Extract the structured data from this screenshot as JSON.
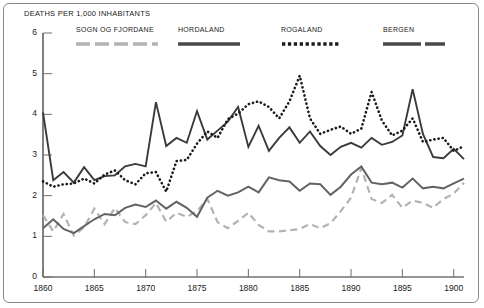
{
  "chart_data": {
    "type": "line",
    "title": "",
    "ylabel": "DEATHS PER 1,000 INHABITANTS",
    "xlabel": "",
    "xlim": [
      1860,
      1901
    ],
    "ylim": [
      0,
      6
    ],
    "grid": false,
    "legend_position": "top",
    "yticks": [
      "0",
      "1",
      "2",
      "3",
      "4",
      "5",
      "6"
    ],
    "ytick_values": [
      0,
      1,
      2,
      3,
      4,
      5,
      6
    ],
    "xticks": [
      "1860",
      "1865",
      "1870",
      "1875",
      "1880",
      "1885",
      "1890",
      "1895",
      "1900"
    ],
    "xtick_values": [
      1860,
      1865,
      1870,
      1875,
      1880,
      1885,
      1890,
      1895,
      1900
    ],
    "x": [
      1860,
      1861,
      1862,
      1863,
      1864,
      1865,
      1866,
      1867,
      1868,
      1869,
      1870,
      1871,
      1872,
      1873,
      1874,
      1875,
      1876,
      1877,
      1878,
      1879,
      1880,
      1881,
      1882,
      1883,
      1884,
      1885,
      1886,
      1887,
      1888,
      1889,
      1890,
      1891,
      1892,
      1893,
      1894,
      1895,
      1896,
      1897,
      1898,
      1899,
      1900,
      1901
    ],
    "series": [
      {
        "name": "SOGN OG FJORDANE",
        "style": "dashed",
        "color": "#b3b3b3",
        "values": [
          1.52,
          1.12,
          1.55,
          1.02,
          1.22,
          1.68,
          1.3,
          1.7,
          1.35,
          1.3,
          1.52,
          1.82,
          1.36,
          1.58,
          1.48,
          1.62,
          1.92,
          1.35,
          1.2,
          1.38,
          1.58,
          1.28,
          1.12,
          1.12,
          1.15,
          1.18,
          1.3,
          1.2,
          1.32,
          1.62,
          1.95,
          2.68,
          1.92,
          1.82,
          2.02,
          1.7,
          1.88,
          1.82,
          1.7,
          1.92,
          2.05,
          2.32
        ]
      },
      {
        "name": "HORDALAND",
        "style": "solid-dark",
        "color": "#3a3a3a",
        "values": [
          4.05,
          2.38,
          2.58,
          2.32,
          2.7,
          2.38,
          2.48,
          2.5,
          2.72,
          2.78,
          2.72,
          4.3,
          3.22,
          3.42,
          3.3,
          4.08,
          3.38,
          3.6,
          3.82,
          4.18,
          3.2,
          3.72,
          3.1,
          3.42,
          3.68,
          3.3,
          3.58,
          3.22,
          3.0,
          3.2,
          3.3,
          3.18,
          3.42,
          3.25,
          3.32,
          3.48,
          4.62,
          3.52,
          2.95,
          2.92,
          3.15,
          2.9
        ]
      },
      {
        "name": "ROGALAND",
        "style": "dotted",
        "color": "#1a1a1a",
        "values": [
          2.35,
          2.22,
          2.28,
          2.3,
          2.42,
          2.3,
          2.52,
          2.62,
          2.38,
          2.28,
          2.55,
          2.58,
          2.1,
          2.85,
          2.88,
          3.28,
          3.58,
          3.42,
          3.88,
          4.02,
          4.25,
          4.32,
          4.18,
          3.9,
          4.32,
          4.95,
          3.9,
          3.52,
          3.62,
          3.7,
          3.52,
          3.65,
          4.55,
          3.85,
          3.48,
          3.6,
          3.9,
          3.32,
          3.38,
          3.42,
          3.1,
          3.22
        ]
      },
      {
        "name": "BERGEN",
        "style": "solid-medium",
        "color": "#636363",
        "values": [
          1.2,
          1.42,
          1.18,
          1.08,
          1.25,
          1.42,
          1.55,
          1.52,
          1.7,
          1.78,
          1.72,
          1.88,
          1.68,
          1.85,
          1.7,
          1.48,
          1.95,
          2.12,
          2.0,
          2.08,
          2.22,
          2.08,
          2.45,
          2.38,
          2.35,
          2.12,
          2.3,
          2.28,
          2.02,
          2.22,
          2.52,
          2.72,
          2.32,
          2.28,
          2.32,
          2.2,
          2.42,
          2.18,
          2.22,
          2.18,
          2.3,
          2.42
        ]
      }
    ]
  },
  "legend": {
    "entries": [
      {
        "label": "SOGN OG FJORDANE",
        "swatch": "dashed-light"
      },
      {
        "label": "HORDALAND",
        "swatch": "solid-dark"
      },
      {
        "label": "ROGALAND",
        "swatch": "dotted-dark"
      },
      {
        "label": "BERGEN",
        "swatch": "dashed-dark"
      }
    ]
  }
}
